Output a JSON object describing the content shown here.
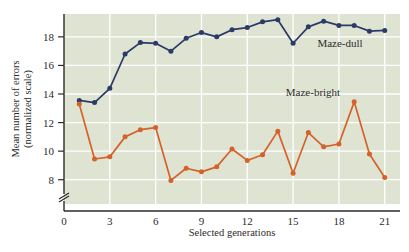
{
  "chart_data": {
    "type": "line",
    "title": "",
    "subtitle": "",
    "xlabel": "Selected generations",
    "ylabel": "Mean number of errors (normalized scale)",
    "ylabel_line1": "Mean number of errors",
    "ylabel_line2": "(normalized scale)",
    "x": [
      1,
      2,
      3,
      4,
      5,
      6,
      7,
      8,
      9,
      10,
      11,
      12,
      13,
      14,
      15,
      16,
      17,
      18,
      19,
      20,
      21
    ],
    "xlim": [
      0,
      22
    ],
    "ylim": [
      7.0,
      19.6
    ],
    "y_axis_break": true,
    "xticks": [
      0,
      3,
      6,
      9,
      12,
      15,
      18,
      21
    ],
    "xtick_labels": [
      "0",
      "3",
      "6",
      "9",
      "12",
      "15",
      "18",
      "21"
    ],
    "yticks": [
      8,
      10,
      12,
      14,
      16,
      18
    ],
    "ytick_labels": [
      "8",
      "10",
      "12",
      "14",
      "16",
      "18"
    ],
    "grid": true,
    "grid_color": "#ffffff",
    "plot_background": "#dfe4d2",
    "legend_position": "inline-annotation",
    "series": [
      {
        "name": "Maze-dull",
        "color": "#2b3a67",
        "marker": "circle",
        "label_text": "Maze-dull",
        "values": [
          13.55,
          13.4,
          14.4,
          16.8,
          17.6,
          17.55,
          17.0,
          17.9,
          18.3,
          18.0,
          18.5,
          18.65,
          19.05,
          19.2,
          17.55,
          18.7,
          19.1,
          18.8,
          18.8,
          18.4,
          18.45
        ]
      },
      {
        "name": "Maze-bright",
        "color": "#d4622a",
        "marker": "circle",
        "label_text": "Maze-bright",
        "values": [
          13.3,
          9.45,
          9.6,
          11.0,
          11.5,
          11.65,
          7.95,
          8.8,
          8.55,
          8.9,
          10.15,
          9.35,
          9.75,
          11.4,
          8.45,
          11.3,
          10.3,
          10.5,
          13.45,
          9.8,
          8.15
        ]
      }
    ],
    "annotations": [
      {
        "name": "maze-dull-label",
        "text": "Maze-dull",
        "x": 18.6,
        "y": 17.85
      },
      {
        "name": "maze-bright-label",
        "text": "Maze-bright",
        "x": 17.0,
        "y": 14.45
      }
    ]
  }
}
